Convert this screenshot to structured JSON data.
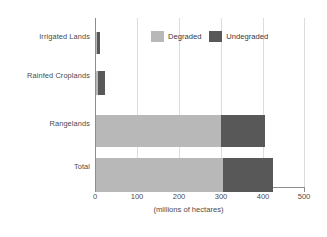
{
  "chart_data": {
    "type": "bar",
    "orientation": "horizontal",
    "stacked": true,
    "title": "",
    "xlabel": "(millions of hectares)",
    "ylabel": "",
    "xlim": [
      0,
      500
    ],
    "xticks": [
      0,
      100,
      200,
      300,
      400,
      500
    ],
    "xtick_labels": [
      "0",
      "100",
      "200",
      "300",
      "400",
      "500"
    ],
    "grid": true,
    "legend_position": "top-center",
    "categories": [
      "Irrigated Lands",
      "Rainfed Croplands",
      "Rangelands",
      "Total"
    ],
    "series": [
      {
        "name": "Degraded",
        "color": "#b8b8b8",
        "values": [
          3,
          5,
          300,
          305
        ]
      },
      {
        "name": "Undegraded",
        "color": "#585858",
        "values": [
          7,
          17,
          105,
          118
        ]
      }
    ],
    "totals": [
      10,
      22,
      405,
      423
    ]
  },
  "legend": {
    "items": [
      {
        "label": "Degraded",
        "color": "#b8b8b8"
      },
      {
        "label": "Undegraded",
        "color": "#585858"
      }
    ]
  },
  "axis": {
    "x_title": "(millions of hectares)",
    "tick_labels": [
      "0",
      "100",
      "200",
      "300",
      "400",
      "500"
    ]
  },
  "colors": {
    "degraded": "#b8b8b8",
    "undegraded": "#585858",
    "grid": "#dcdcdc",
    "axis": "#8c8c8c",
    "text": "#4a4a4a",
    "background": "#ffffff"
  }
}
